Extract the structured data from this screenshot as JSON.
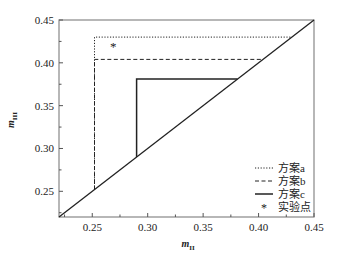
{
  "chart_data": {
    "type": "line",
    "title": "",
    "xlabel": "m_II",
    "ylabel": "m_III",
    "xlim": [
      0.22,
      0.45
    ],
    "ylim": [
      0.22,
      0.45
    ],
    "grid": false,
    "x_ticks": [
      "0.25",
      "0.30",
      "0.35",
      "0.40",
      "0.45"
    ],
    "y_ticks": [
      "0.25",
      "0.30",
      "0.35",
      "0.40",
      "0.45"
    ],
    "legend_position": "lower right",
    "series": [
      {
        "name": "方案a",
        "style": "dotted",
        "points": [
          [
            0.252,
            0.252
          ],
          [
            0.252,
            0.43
          ],
          [
            0.43,
            0.43
          ]
        ]
      },
      {
        "name": "方案b",
        "style": "dashed",
        "points": [
          [
            0.252,
            0.252
          ],
          [
            0.252,
            0.404
          ],
          [
            0.404,
            0.404
          ]
        ]
      },
      {
        "name": "方案c",
        "style": "solid",
        "points": [
          [
            0.29,
            0.29
          ],
          [
            0.29,
            0.381
          ],
          [
            0.381,
            0.381
          ]
        ]
      },
      {
        "name": "实验点",
        "style": "marker-asterisk",
        "points": [
          [
            0.269,
            0.42
          ]
        ]
      },
      {
        "name": "diagonal",
        "style": "solid",
        "points": [
          [
            0.22,
            0.22
          ],
          [
            0.45,
            0.45
          ]
        ]
      }
    ]
  },
  "axis": {
    "xlabel_main": "m",
    "xlabel_sub": "II",
    "ylabel_main": "m",
    "ylabel_sub": "III"
  },
  "legend": [
    {
      "label": "方案a",
      "style": "dotted"
    },
    {
      "label": "方案b",
      "style": "dashed"
    },
    {
      "label": "方案c",
      "style": "solid"
    },
    {
      "label": "实验点",
      "style": "marker"
    }
  ],
  "colors": {
    "line": "#222222",
    "frame": "#888888"
  }
}
